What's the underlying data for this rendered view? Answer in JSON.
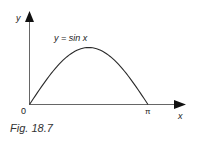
{
  "chart_data": {
    "type": "line",
    "title": "",
    "curve_label": "y = sin x",
    "xlabel": "x",
    "ylabel": "y",
    "x_ticks": [
      "0",
      "π"
    ],
    "x": [
      0,
      0.3927,
      0.7854,
      1.1781,
      1.5708,
      1.9635,
      2.3562,
      2.7489,
      3.1416
    ],
    "series": [
      {
        "name": "y = sin x",
        "values": [
          0,
          0.3827,
          0.7071,
          0.9239,
          1.0,
          0.9239,
          0.7071,
          0.3827,
          0
        ]
      }
    ],
    "xlim": [
      0,
      3.1416
    ],
    "grid": false,
    "legend": "none"
  },
  "labels": {
    "y_axis": "y",
    "x_axis": "x",
    "origin": "0",
    "pi": "π",
    "curve": "y = sin x"
  },
  "caption": "Fig. 18.7",
  "colors": {
    "axis": "#555555",
    "curve": "#2a2a2a",
    "text": "#1a1a1a"
  }
}
